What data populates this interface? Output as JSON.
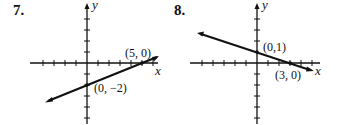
{
  "figures": [
    {
      "number": "7.",
      "x_axis_label": "x",
      "y_axis_label": "y",
      "line": {
        "slope": 0.4,
        "intercept": -2,
        "equation_implied": "y = (2/5)x - 2"
      },
      "points": [
        {
          "label": "(5, 0)",
          "x": 5,
          "y": 0
        },
        {
          "label": "(0, −2)",
          "x": 0,
          "y": -2
        }
      ]
    },
    {
      "number": "8.",
      "x_axis_label": "x",
      "y_axis_label": "y",
      "line": {
        "slope": -0.3333,
        "intercept": 1,
        "equation_implied": "y = -(1/3)x + 1"
      },
      "points": [
        {
          "label": "(0,1)",
          "x": 0,
          "y": 1
        },
        {
          "label": "(3, 0)",
          "x": 3,
          "y": 0
        }
      ]
    }
  ]
}
